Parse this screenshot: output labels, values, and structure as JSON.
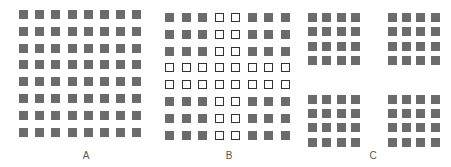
{
  "figure": {
    "colors": {
      "filled": "#6b6b6b",
      "hollow_border": "#333333",
      "background": "#ffffff",
      "label": "#555555"
    },
    "panels": [
      {
        "id": "A",
        "label": "A",
        "rows": 8,
        "cols": 8,
        "pattern": "all filled squares, uniform spacing",
        "origin": [
          19,
          10
        ],
        "step": [
          16.2,
          16.8
        ],
        "label_pos": [
          86,
          150
        ]
      },
      {
        "id": "B",
        "label": "B",
        "rows": 8,
        "cols": 8,
        "pattern": "filled squares except columns 4-5 and rows 4-5 which are hollow outlines (cross shape)",
        "hollow_cols": [
          3,
          4
        ],
        "hollow_rows": [
          3,
          4
        ],
        "origin": [
          165,
          13
        ],
        "step": [
          16.5,
          16.8
        ],
        "label_pos": [
          229,
          150
        ]
      },
      {
        "id": "C",
        "label": "C",
        "rows": 8,
        "cols": 8,
        "pattern": "all filled squares grouped into four 4x4 clusters separated by wider gaps",
        "origin": [
          308,
          13
        ],
        "step": [
          14.4,
          14.4
        ],
        "gap": [
          22,
          24
        ],
        "label_pos": [
          373,
          150
        ]
      }
    ]
  }
}
